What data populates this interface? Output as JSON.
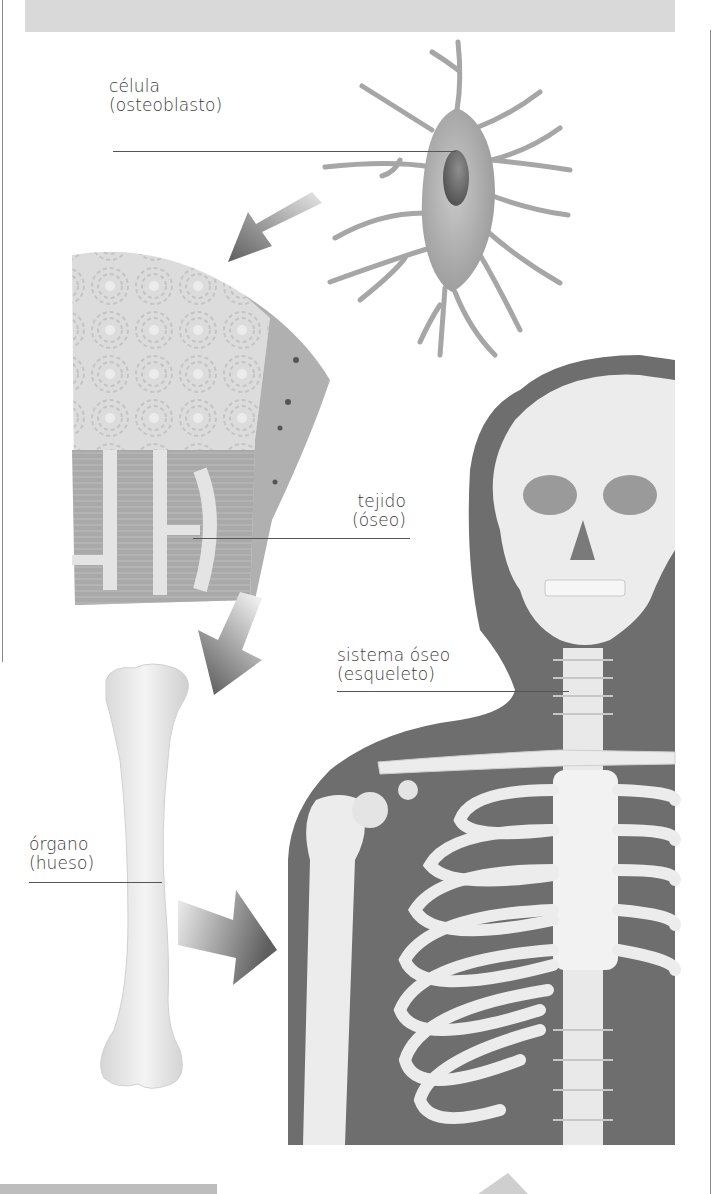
{
  "diagram": {
    "levels": [
      {
        "id": "cell",
        "name": "célula",
        "detail": "(osteoblasto)"
      },
      {
        "id": "tissue",
        "name": "tejido",
        "detail": "(óseo)"
      },
      {
        "id": "system",
        "name": "sistema óseo",
        "detail": "(esqueleto)"
      },
      {
        "id": "organ",
        "name": "órgano",
        "detail": "(hueso)"
      }
    ],
    "flow": [
      "célula",
      "tejido",
      "órgano",
      "sistema óseo"
    ],
    "colors": {
      "silhouette": "#6e6e6e",
      "bone": "#ececec",
      "cell": "#a8a8a8",
      "nucleus": "#6a6a6a",
      "arrow_dark": "#6b6b6b",
      "arrow_light": "#e0e0e0",
      "banner": "#d9d9d9",
      "text": "#3a3a3a"
    }
  }
}
